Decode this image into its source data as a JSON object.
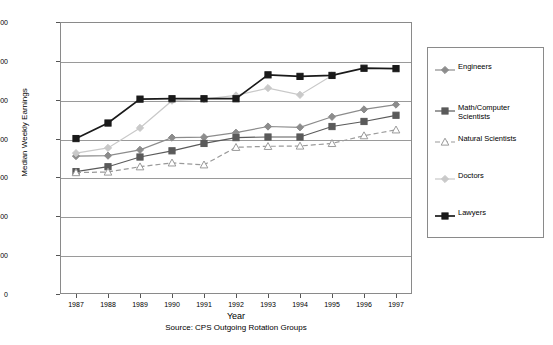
{
  "chart_data": {
    "type": "line",
    "title": "",
    "xlabel": "Year",
    "ylabel": "Median Weekly Earnings",
    "source": "Source: CPS Outgoing Rotation Groups",
    "categories": [
      "1987",
      "1988",
      "1989",
      "1990",
      "1991",
      "1992",
      "1993",
      "1994",
      "1995",
      "1996",
      "1997"
    ],
    "ylim": [
      0,
      1400
    ],
    "yticks": [
      0,
      200,
      400,
      600,
      800,
      1000,
      1200,
      1400
    ],
    "grid": true,
    "legend_position": "right",
    "series": [
      {
        "name": "Engineers",
        "color": "#8c8c8c",
        "marker": "diamond",
        "marker_fill": "#8c8c8c",
        "dash": "none",
        "values": [
          710,
          712,
          742,
          805,
          807,
          830,
          862,
          858,
          912,
          950,
          975
        ]
      },
      {
        "name": "Math/Computer Scientists",
        "color": "#5a5a5a",
        "marker": "square",
        "marker_fill": "#5a5a5a",
        "dash": "none",
        "values": [
          630,
          655,
          705,
          737,
          775,
          805,
          808,
          808,
          862,
          888,
          920
        ]
      },
      {
        "name": "Natural Scientists",
        "color": "#9a9a9a",
        "marker": "triangle",
        "marker_fill": "#ffffff",
        "dash": "dashed",
        "values": [
          625,
          628,
          655,
          675,
          665,
          755,
          760,
          762,
          775,
          815,
          845
        ]
      },
      {
        "name": "Doctors",
        "color": "#c9c9c9",
        "marker": "diamond",
        "marker_fill": "#c9c9c9",
        "dash": "none",
        "values": [
          725,
          752,
          855,
          995,
          1003,
          1022,
          1060,
          1025,
          1125,
          null,
          null
        ]
      },
      {
        "name": "Lawyers",
        "color": "#1a1a1a",
        "marker": "square",
        "marker_fill": "#1a1a1a",
        "dash": "none",
        "values": [
          800,
          880,
          1003,
          1005,
          1005,
          1005,
          1128,
          1120,
          1125,
          1162,
          1160
        ]
      }
    ]
  },
  "legend": {
    "entries": [
      {
        "label": "Engineers"
      },
      {
        "label": "Math/Computer Scientists"
      },
      {
        "label": "Natural Scientists"
      },
      {
        "label": "Doctors"
      },
      {
        "label": "Lawyers"
      }
    ]
  }
}
